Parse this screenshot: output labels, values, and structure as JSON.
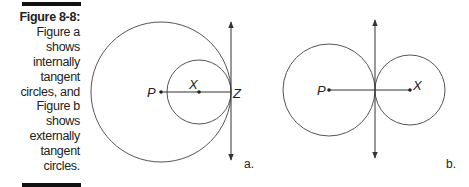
{
  "caption": {
    "title": "Figure 8-8:",
    "lines": [
      "Figure a",
      "shows",
      "internally",
      "tangent",
      "circles, and",
      "Figure b",
      "shows",
      "externally",
      "tangent",
      "circles."
    ]
  },
  "figure_a": {
    "label": "a.",
    "points": {
      "P": "P",
      "X": "X",
      "Z": "Z"
    }
  },
  "figure_b": {
    "label": "b.",
    "points": {
      "P": "P",
      "X": "X"
    }
  },
  "colors": {
    "stroke": "#333333",
    "text": "#222222"
  }
}
